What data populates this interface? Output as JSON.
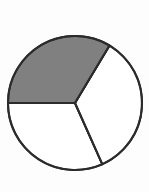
{
  "figure": {
    "name": "pie-chart-three-sectors",
    "background_color": "#fdfdfd",
    "outline_color": "#2b2b2b",
    "outline_width": 2,
    "center_x": 75,
    "center_y": 103,
    "radius": 67
  },
  "chart_data": {
    "type": "pie",
    "title": "",
    "subtitle": "",
    "xlabel": "",
    "ylabel": "",
    "grid": false,
    "legend": false,
    "legend_position": "none",
    "labels": [
      "Shaded sector",
      "Right sector",
      "Bottom-left sector"
    ],
    "values": [
      121,
      125,
      114
    ],
    "value_unit": "degrees",
    "fractions": [
      0.336,
      0.347,
      0.317
    ],
    "colors": [
      "#808080",
      "#ffffff",
      "#ffffff"
    ],
    "start_angle_deg": 180,
    "direction": "clockwise",
    "sectors": [
      {
        "name": "shaded-sector",
        "fill": "#808080",
        "shaded": true,
        "start_angle_deg": 180,
        "end_angle_deg": 59,
        "sweep_deg": 121,
        "fraction": 0.336,
        "annotation": ""
      },
      {
        "name": "right-sector",
        "fill": "#ffffff",
        "shaded": false,
        "start_angle_deg": 59,
        "end_angle_deg": -66,
        "sweep_deg": 125,
        "fraction": 0.347,
        "annotation": ""
      },
      {
        "name": "bottom-left-sector",
        "fill": "#ffffff",
        "shaded": false,
        "start_angle_deg": -66,
        "end_angle_deg": -180,
        "sweep_deg": 114,
        "fraction": 0.317,
        "annotation": ""
      }
    ],
    "annotations": []
  }
}
